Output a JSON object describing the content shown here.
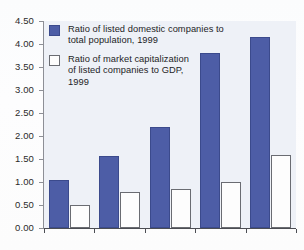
{
  "chart_data": {
    "type": "bar",
    "title": "",
    "subtitle": "",
    "xlabel": "",
    "ylabel": "",
    "ylim": [
      0.0,
      4.5
    ],
    "ytick_step": 0.5,
    "ytick_labels": [
      "4.50",
      "4.00",
      "3.50",
      "3.00",
      "2.50",
      "2.00",
      "1.50",
      "1.00",
      "0.50",
      "0.00"
    ],
    "ytick_values": [
      4.5,
      4.0,
      3.5,
      3.0,
      2.5,
      2.0,
      1.5,
      1.0,
      0.5,
      0.0
    ],
    "grid": false,
    "legend_position": "top-left",
    "categories": [
      "",
      "",
      "",
      "",
      ""
    ],
    "xtick_labels": [
      "",
      "",
      "",
      "",
      ""
    ],
    "series": [
      {
        "name": "Ratio of listed domestic companies to total population, 1999",
        "color": "#4d5da6",
        "values": [
          1.05,
          1.56,
          2.2,
          3.8,
          4.15
        ]
      },
      {
        "name": "Ratio of market capitalization of listed companies to GDP, 1999",
        "color": "#fdfdfd",
        "values": [
          0.49,
          0.78,
          0.85,
          1.0,
          1.58
        ]
      }
    ],
    "annotations": []
  },
  "legend": {
    "items": [
      {
        "swatch": "blue",
        "line1": "Ratio of listed domestic companies to",
        "line2": "total population, 1999",
        "line3": ""
      },
      {
        "swatch": "white",
        "line1": "Ratio of market capitalization",
        "line2": "of listed companies to GDP,",
        "line3": "1999"
      }
    ]
  },
  "colors": {
    "series_blue": "#4d5da6",
    "series_blue_border": "#3b4a8c",
    "series_white": "#fdfdfd",
    "series_white_border": "#6a6c72",
    "plot_background": "#eef1f7",
    "axis": "#4b4d53",
    "text": "#1d1d1f"
  }
}
